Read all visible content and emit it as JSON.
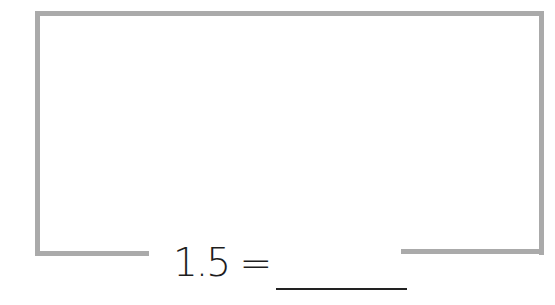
{
  "colors": {
    "frame": "#aaaaaa",
    "text": "#1e1e1e",
    "answer_line": "#222222"
  },
  "equation": {
    "text": "1.5 =",
    "answer_value": ""
  }
}
